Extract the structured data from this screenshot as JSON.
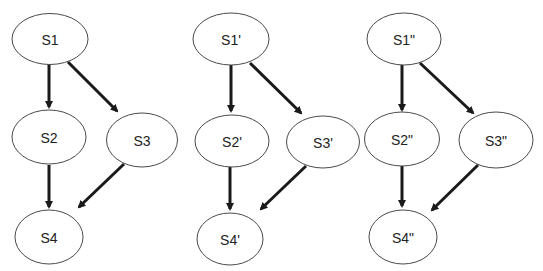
{
  "diagram": {
    "graphs": [
      {
        "nodes": [
          {
            "id": "S1",
            "label": "S1"
          },
          {
            "id": "S2",
            "label": "S2"
          },
          {
            "id": "S3",
            "label": "S3"
          },
          {
            "id": "S4",
            "label": "S4"
          }
        ],
        "edges": [
          [
            "S1",
            "S2"
          ],
          [
            "S1",
            "S3"
          ],
          [
            "S2",
            "S4"
          ],
          [
            "S3",
            "S4"
          ]
        ]
      },
      {
        "nodes": [
          {
            "id": "S1p",
            "label": "S1'"
          },
          {
            "id": "S2p",
            "label": "S2'"
          },
          {
            "id": "S3p",
            "label": "S3'"
          },
          {
            "id": "S4p",
            "label": "S4'"
          }
        ],
        "edges": [
          [
            "S1'",
            "S2'"
          ],
          [
            "S1'",
            "S3'"
          ],
          [
            "S2'",
            "S4'"
          ],
          [
            "S3'",
            "S4'"
          ]
        ]
      },
      {
        "nodes": [
          {
            "id": "S1pp",
            "label": "S1\""
          },
          {
            "id": "S2pp",
            "label": "S2\""
          },
          {
            "id": "S3pp",
            "label": "S3\""
          },
          {
            "id": "S4pp",
            "label": "S4\""
          }
        ],
        "edges": [
          [
            "S1\"",
            "S2\""
          ],
          [
            "S1\"",
            "S3\""
          ],
          [
            "S2\"",
            "S4\""
          ],
          [
            "S3\"",
            "S4\""
          ]
        ]
      }
    ]
  }
}
